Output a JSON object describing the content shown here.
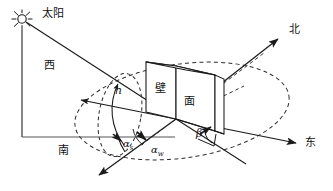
{
  "diagram": {
    "title_text": "",
    "sun": {
      "icon_name": "sun-icon",
      "label": "太阳"
    },
    "compass": {
      "west": "西",
      "north": "北",
      "south": "南",
      "east": "东"
    },
    "wall": {
      "label_left": "壁",
      "label_right": "面"
    },
    "angles": {
      "altitude": "h",
      "solar_azimuth_base": "α",
      "solar_azimuth_sub": "s",
      "wall_azimuth_base": "α",
      "wall_azimuth_sub": "w",
      "beta": "β"
    },
    "colors": {
      "line": "#1a1a1a",
      "dashed": "#2b2b2b",
      "background": "#ffffff"
    }
  }
}
